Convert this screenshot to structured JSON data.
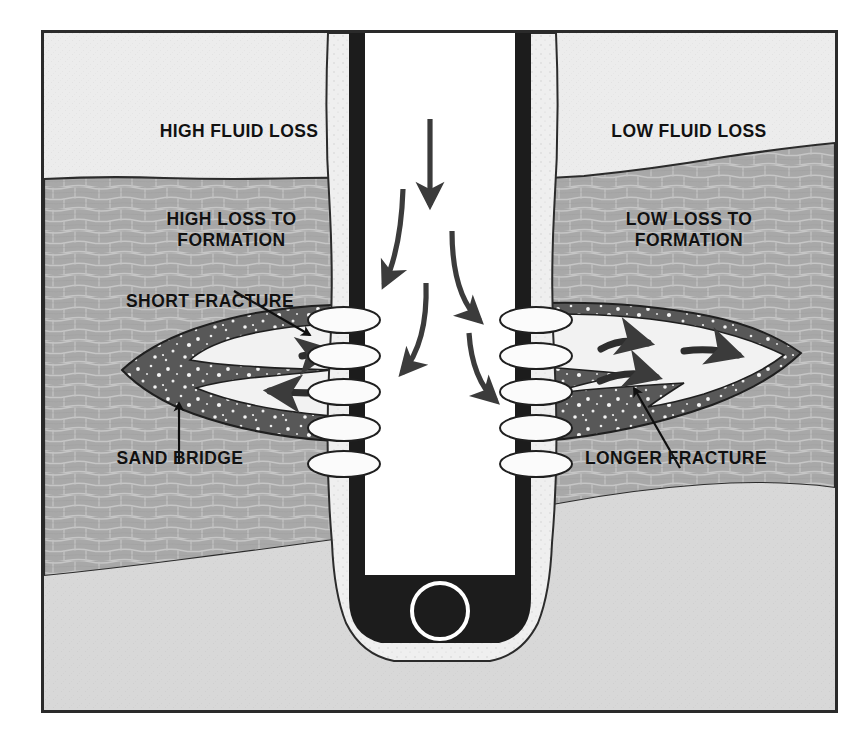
{
  "figure": {
    "kind": "cross-section-diagram",
    "frame_border_color": "#2a2a2a",
    "background_color": "#f0f0f0"
  },
  "colors": {
    "overburden_light": "#ececec",
    "rock_formation": "#a8a8a8",
    "lower_formation": "#d8d8d8",
    "casing_steel": "#1c1c1c",
    "cement_sheath": "#efefef",
    "fracture_sand": "#585858",
    "fracture_void": "#f2f2f2",
    "arrow": "#3b3b3b",
    "label_text": "#111111"
  },
  "labels": {
    "high_fluid_loss": "HIGH FLUID LOSS",
    "low_fluid_loss": "LOW FLUID LOSS",
    "high_loss_to_formation": "HIGH LOSS TO\nFORMATION",
    "low_loss_to_formation": "LOW LOSS TO\nFORMATION",
    "short_fracture": "SHORT FRACTURE",
    "sand_bridge": "SAND BRIDGE",
    "longer_fracture": "LONGER FRACTURE"
  },
  "annotations": {
    "leaders": [
      {
        "name": "short-fracture-leader",
        "from_label": "SHORT FRACTURE",
        "points_to": "left fracture body"
      },
      {
        "name": "sand-bridge-leader",
        "from_label": "SAND BRIDGE",
        "points_to": "left fracture sand pack"
      },
      {
        "name": "longer-fracture-leader",
        "from_label": "LONGER FRACTURE",
        "points_to": "right fracture body"
      }
    ]
  },
  "scene": {
    "wellbore": {
      "name": "cased wellbore",
      "perforation_count_per_side": 5,
      "has_casing_shoe": true,
      "shoe_marker": "circle"
    },
    "left_side": {
      "fracture_type": "short",
      "fracture_filled_with_sand": true,
      "flow_arrows": 2
    },
    "right_side": {
      "fracture_type": "longer",
      "fracture_filled_with_sand": false,
      "flow_arrows": 4
    },
    "internal_flow_arrows": 5
  }
}
